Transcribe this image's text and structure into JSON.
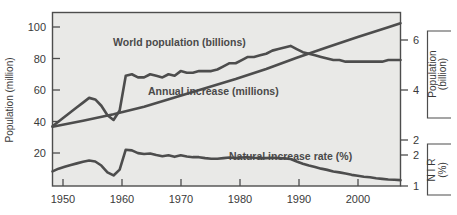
{
  "chart_data": {
    "type": "line",
    "title": "",
    "xlabel": "",
    "grid": false,
    "legend_position": "inline-annotations",
    "xlim": [
      1950,
      2007
    ],
    "x_ticks": [
      1950,
      1960,
      1970,
      1980,
      1990,
      2000
    ],
    "x_tick_labels": [
      "1950",
      "1960",
      "1970",
      "1980",
      "2000_placeholder",
      "2000"
    ],
    "axes": {
      "left": {
        "title": "Population (million)",
        "ticks": [
          20,
          40,
          60,
          80,
          100
        ],
        "tick_labels": [
          "20",
          "40",
          "60",
          "80",
          "100"
        ],
        "lim": [
          0,
          112
        ]
      },
      "right_upper": {
        "title_line1": "Population",
        "title_line2": "(billion)",
        "ticks": [
          2,
          4,
          6
        ],
        "tick_labels": [
          "2",
          "4",
          "6"
        ],
        "lim": [
          1.0,
          7.2
        ]
      },
      "right_lower": {
        "title_line1": "N I R",
        "title_line2": "(%)",
        "ticks": [
          1,
          2
        ],
        "tick_labels": [
          "1",
          "2"
        ],
        "lim": [
          0.85,
          2.35
        ]
      }
    },
    "series": [
      {
        "name": "world-population",
        "label": "World population (billions)",
        "units": "billions",
        "axis": "right_upper",
        "x": [
          1950,
          1955,
          1960,
          1965,
          1970,
          1975,
          1980,
          1985,
          1990,
          1995,
          2000,
          2005,
          2007
        ],
        "values": [
          2.53,
          2.77,
          3.03,
          3.33,
          3.7,
          4.07,
          4.44,
          4.84,
          5.29,
          5.71,
          6.12,
          6.51,
          6.67
        ]
      },
      {
        "name": "annual-increase",
        "label": "Annual increase (millions)",
        "units": "millions",
        "axis": "left",
        "x": [
          1950,
          1951,
          1952,
          1953,
          1954,
          1955,
          1956,
          1957,
          1958,
          1959,
          1960,
          1961,
          1962,
          1963,
          1964,
          1965,
          1966,
          1967,
          1968,
          1969,
          1970,
          1971,
          1972,
          1973,
          1974,
          1975,
          1976,
          1977,
          1978,
          1979,
          1980,
          1981,
          1982,
          1983,
          1984,
          1985,
          1986,
          1987,
          1988,
          1989,
          1990,
          1991,
          1992,
          1993,
          1994,
          1995,
          1996,
          1997,
          1998,
          1999,
          2000,
          2001,
          2002,
          2003,
          2004,
          2005,
          2006,
          2007
        ],
        "values": [
          37,
          40,
          43,
          46,
          49,
          52,
          55,
          54,
          50,
          44,
          41,
          47,
          69,
          70,
          68,
          68,
          70,
          69,
          68,
          70,
          69,
          72,
          71,
          71,
          72,
          72,
          72,
          73,
          75,
          77,
          77,
          79,
          81,
          81,
          82,
          83,
          85,
          86,
          87,
          88,
          86,
          84,
          83,
          82,
          81,
          80,
          79,
          79,
          78,
          78,
          78,
          78,
          78,
          78,
          78,
          79,
          79,
          79
        ]
      },
      {
        "name": "natural-increase-rate",
        "label": "Natural increase rate (%)",
        "units": "percent",
        "axis": "right_lower",
        "x": [
          1950,
          1951,
          1952,
          1953,
          1954,
          1955,
          1956,
          1957,
          1958,
          1959,
          1960,
          1961,
          1962,
          1963,
          1964,
          1965,
          1966,
          1967,
          1968,
          1969,
          1970,
          1971,
          1972,
          1973,
          1974,
          1975,
          1976,
          1977,
          1978,
          1979,
          1980,
          1981,
          1982,
          1983,
          1984,
          1985,
          1986,
          1987,
          1988,
          1989,
          1990,
          1991,
          1992,
          1993,
          1994,
          1995,
          1996,
          1997,
          1998,
          1999,
          2000,
          2001,
          2002,
          2003,
          2004,
          2005,
          2006,
          2007
        ],
        "values": [
          1.47,
          1.56,
          1.62,
          1.68,
          1.73,
          1.78,
          1.82,
          1.79,
          1.66,
          1.44,
          1.34,
          1.53,
          2.17,
          2.15,
          2.06,
          2.03,
          2.05,
          2.0,
          1.96,
          1.99,
          1.94,
          1.99,
          1.95,
          1.93,
          1.93,
          1.9,
          1.88,
          1.88,
          1.9,
          1.92,
          1.9,
          1.92,
          1.93,
          1.91,
          1.9,
          1.9,
          1.91,
          1.9,
          1.89,
          1.87,
          1.79,
          1.72,
          1.66,
          1.61,
          1.56,
          1.52,
          1.47,
          1.44,
          1.4,
          1.36,
          1.33,
          1.3,
          1.28,
          1.25,
          1.23,
          1.21,
          1.2,
          1.19
        ]
      }
    ],
    "annotations": [
      {
        "name": "world-population-annotation",
        "text": "World population (billions)"
      },
      {
        "name": "annual-increase-annotation",
        "text": "Annual increase (millions)"
      },
      {
        "name": "natural-increase-rate-annotation",
        "text": "Natural increase rate (%)"
      }
    ]
  },
  "left_axis": {
    "title": "Population (million)",
    "ticks": [
      "100",
      "80",
      "60",
      "40",
      "20"
    ]
  },
  "right_upper_axis": {
    "title_line1": "Population",
    "title_line2": "(billion)",
    "ticks": [
      "6",
      "4",
      "2"
    ]
  },
  "right_lower_axis": {
    "title_line1": "N I R",
    "title_line2": "(%)",
    "ticks": [
      "2",
      "1"
    ]
  },
  "x_axis": {
    "ticks": [
      "1950",
      "1960",
      "1970",
      "1980",
      "1990",
      "2000"
    ]
  },
  "labels": {
    "world_population": "World population (billions)",
    "annual_increase": "Annual increase (millions)",
    "natural_increase_rate": "Natural increase rate (%)"
  },
  "colors": {
    "plot_background": "#e9e9e7",
    "line": "#4d4d4d",
    "text": "#3a3a3a",
    "page_background": "#ffffff"
  }
}
